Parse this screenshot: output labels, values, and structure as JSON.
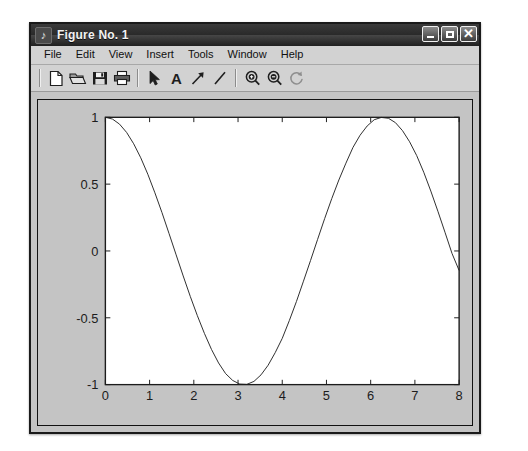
{
  "window": {
    "title": "Figure No. 1",
    "title_icon": "figure-note-icon",
    "controls": [
      {
        "name": "minimize-button",
        "label": "_"
      },
      {
        "name": "maximize-button",
        "label": "□"
      },
      {
        "name": "close-button",
        "label": "×"
      }
    ]
  },
  "menu": {
    "items": [
      {
        "label": "File"
      },
      {
        "label": "Edit"
      },
      {
        "label": "View"
      },
      {
        "label": "Insert"
      },
      {
        "label": "Tools"
      },
      {
        "label": "Window"
      },
      {
        "label": "Help"
      }
    ]
  },
  "toolbar": {
    "groups": [
      {
        "buttons": [
          {
            "name": "new-figure-button",
            "icon": "new-document-icon",
            "title": "New Figure"
          },
          {
            "name": "open-file-button",
            "icon": "open-folder-icon",
            "title": "Open File"
          },
          {
            "name": "save-figure-button",
            "icon": "save-floppy-icon",
            "title": "Save Figure"
          },
          {
            "name": "print-figure-button",
            "icon": "printer-icon",
            "title": "Print Figure"
          }
        ]
      },
      {
        "buttons": [
          {
            "name": "edit-plot-button",
            "icon": "pointer-arrow-icon",
            "title": "Edit Plot"
          },
          {
            "name": "insert-text-button",
            "icon": "text-a-icon",
            "title": "Insert Text"
          },
          {
            "name": "insert-arrow-button",
            "icon": "arrow-annotation-icon",
            "title": "Insert Arrow"
          },
          {
            "name": "insert-line-button",
            "icon": "line-annotation-icon",
            "title": "Insert Line"
          }
        ]
      },
      {
        "buttons": [
          {
            "name": "zoom-in-button",
            "icon": "magnifier-plus-icon",
            "title": "Zoom In"
          },
          {
            "name": "zoom-out-button",
            "icon": "magnifier-minus-icon",
            "title": "Zoom Out"
          },
          {
            "name": "rotate-3d-button",
            "icon": "rotate-arrow-icon",
            "title": "Rotate 3D"
          }
        ]
      }
    ]
  },
  "colors": {
    "window_frame": "#1a1a1a",
    "figure_background": "#c4c4c4",
    "axes_background": "#ffffff",
    "axes_line": "#1c1c1c",
    "plot_line": "#2a2a2a",
    "titlebar_text": "#f2f2f2"
  },
  "chart_data": {
    "type": "line",
    "title": "",
    "xlabel": "",
    "ylabel": "",
    "xlim": [
      0,
      8
    ],
    "ylim": [
      -1,
      1
    ],
    "xticks": [
      0,
      1,
      2,
      3,
      4,
      5,
      6,
      7,
      8
    ],
    "xticklabels": [
      "0",
      "1",
      "2",
      "3",
      "4",
      "5",
      "6",
      "7",
      "8"
    ],
    "yticks": [
      -1,
      -0.5,
      0,
      0.5,
      1
    ],
    "yticklabels": [
      "-1",
      "-0.5",
      "0",
      "0.5",
      "1"
    ],
    "grid": false,
    "legend": null,
    "box": true,
    "series": [
      {
        "name": "cos(x)",
        "expression": "cos(x)",
        "color": "#2a2a2a",
        "linewidth": 1,
        "x": [
          0,
          0.16,
          0.32,
          0.48,
          0.64,
          0.8,
          0.96,
          1.12,
          1.28,
          1.44,
          1.6,
          1.76,
          1.92,
          2.08,
          2.24,
          2.4,
          2.56,
          2.72,
          2.88,
          3.04,
          3.2,
          3.36,
          3.52,
          3.68,
          3.84,
          4.0,
          4.16,
          4.32,
          4.48,
          4.64,
          4.8,
          4.96,
          5.12,
          5.28,
          5.44,
          5.6,
          5.76,
          5.92,
          6.08,
          6.24,
          6.4,
          6.56,
          6.72,
          6.88,
          7.04,
          7.2,
          7.36,
          7.52,
          7.68,
          7.84,
          8.0
        ],
        "y": [
          1.0,
          0.987,
          0.949,
          0.887,
          0.802,
          0.697,
          0.574,
          0.435,
          0.287,
          0.13,
          -0.029,
          -0.187,
          -0.34,
          -0.484,
          -0.617,
          -0.737,
          -0.838,
          -0.918,
          -0.969,
          -0.996,
          -0.998,
          -0.976,
          -0.927,
          -0.855,
          -0.761,
          -0.654,
          -0.521,
          -0.379,
          -0.226,
          -0.071,
          0.087,
          0.243,
          0.392,
          0.531,
          0.657,
          0.775,
          0.866,
          0.935,
          0.982,
          0.999,
          0.993,
          0.96,
          0.9,
          0.817,
          0.714,
          0.589,
          0.448,
          0.297,
          0.14,
          -0.019,
          -0.146
        ]
      }
    ]
  }
}
